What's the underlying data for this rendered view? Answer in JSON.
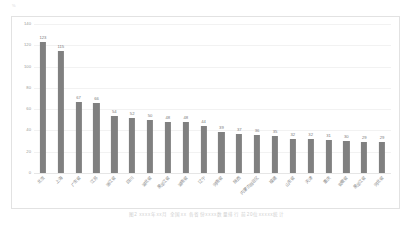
{
  "corner_mark": "%",
  "caption": "图2  xxxx年xx月  全国xx  各省份xxxx数量排行  前20位xxxxx统计",
  "colors": {
    "bar": "#808080",
    "grid": "#f2f2f2",
    "frame": "#e2e2e2",
    "label_text": "#7a7a7a",
    "axis_text": "#9a9a9a"
  },
  "chart_data": {
    "type": "bar",
    "title": "",
    "subtitle": "",
    "xlabel": "",
    "ylabel": "",
    "ylim": [
      0,
      140
    ],
    "ytick_labels": [
      "0",
      "20",
      "40",
      "60",
      "80",
      "100",
      "120",
      "140"
    ],
    "yticks": [
      0,
      20,
      40,
      60,
      80,
      100,
      120,
      140
    ],
    "grid": true,
    "legend": false,
    "legend_position": "none",
    "categories": [
      "北京",
      "上海",
      "广东省",
      "江苏",
      "浙江省",
      "四川",
      "湖北省",
      "黑龙江省",
      "湖南省",
      "辽宁",
      "河南省",
      "陕西",
      "内蒙古自治区",
      "福建",
      "山东省",
      "天津",
      "重庆",
      "安徽省",
      "黑龙江省",
      "河北省"
    ],
    "values": [
      123,
      115,
      67,
      66,
      54,
      52,
      50,
      48,
      48,
      44,
      39,
      37,
      36,
      35,
      32,
      32,
      31,
      30,
      29,
      29
    ],
    "data_labels": [
      "123",
      "115",
      "67",
      "66",
      "54",
      "52",
      "50",
      "48",
      "48",
      "44",
      "39",
      "37",
      "36",
      "35",
      "32",
      "32",
      "31",
      "30",
      "29",
      "29"
    ]
  }
}
